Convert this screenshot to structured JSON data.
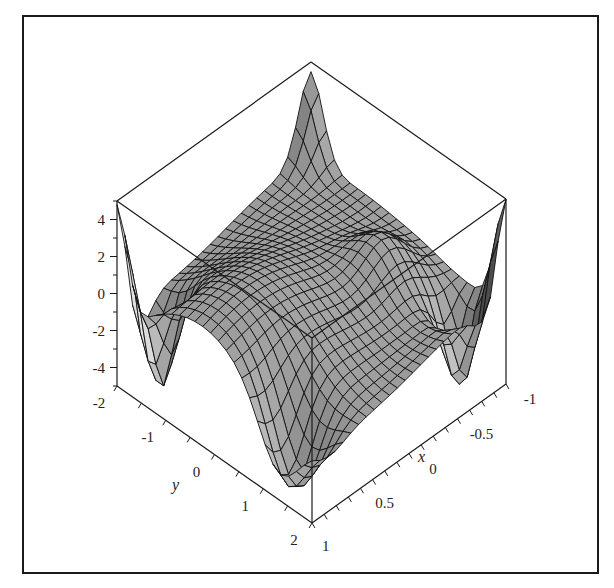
{
  "chart_data": {
    "type": "surface3d",
    "title": "",
    "xlabel": "x",
    "ylabel": "y",
    "zlabel": "",
    "x_range": [
      -1,
      1
    ],
    "y_range": [
      -2,
      2
    ],
    "z_range": [
      -5,
      5
    ],
    "x_ticks": [
      {
        "value": -1,
        "label": "-1"
      },
      {
        "value": -0.5,
        "label": "-0.5"
      },
      {
        "value": 0,
        "label": "0"
      },
      {
        "value": 0.5,
        "label": "0.5"
      },
      {
        "value": 1,
        "label": "1"
      }
    ],
    "y_ticks": [
      {
        "value": -2,
        "label": "-2"
      },
      {
        "value": -1,
        "label": "-1"
      },
      {
        "value": 0,
        "label": "0"
      },
      {
        "value": 1,
        "label": "1"
      },
      {
        "value": 2,
        "label": "2"
      }
    ],
    "z_ticks": [
      {
        "value": 4,
        "label": "4"
      },
      {
        "value": 2,
        "label": "2"
      },
      {
        "value": 0,
        "label": "0"
      },
      {
        "value": -2,
        "label": "-2"
      },
      {
        "value": -4,
        "label": "-4"
      }
    ],
    "grid_resolution": [
      25,
      25
    ],
    "style": "patch with wireframe mesh, grayscale shading",
    "box": "framed 3D box",
    "colors": {
      "surface_light": "#d9d9d9",
      "surface_dark": "#4a4a4a",
      "mesh": "#111111",
      "axes": "#1a1a1a",
      "frame": "#1a1a1a"
    },
    "features": [
      "sharp peak at back corner (x=-1, y=-2) reaching z≈5",
      "high values near left corner (x=1,y=-2) and right corner (x=-1,y=2) edges",
      "deep troughs near z≈-5 along front edges",
      "central saddle-shaped plateau near z≈0..2"
    ]
  },
  "labels": {
    "x_axis_title": "x",
    "y_axis_title": "y"
  }
}
